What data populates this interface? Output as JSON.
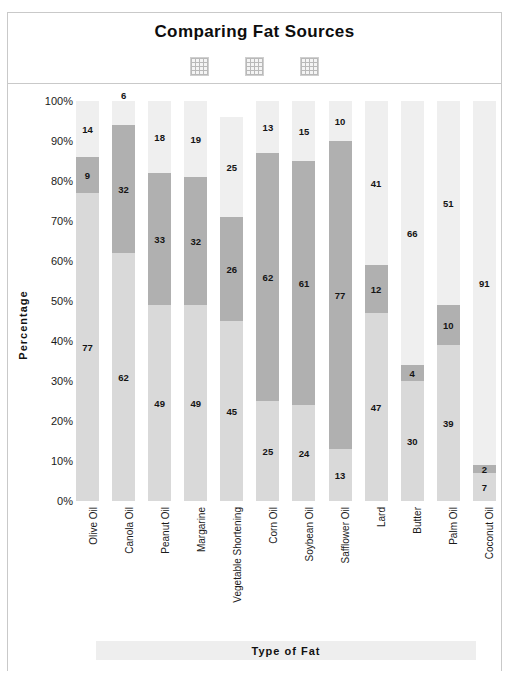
{
  "chart_data": {
    "type": "bar",
    "subtype": "stacked-bar-100-percent",
    "title": "Comparing Fat Sources",
    "xlabel": "Type of Fat",
    "ylabel": "Percentage",
    "ylim": [
      0,
      100
    ],
    "grid": false,
    "legend_position": "top",
    "legend": [
      {
        "label": "",
        "swatch": "hatched-pattern-swatch"
      },
      {
        "label": "",
        "swatch": "hatched-pattern-swatch"
      },
      {
        "label": "",
        "swatch": "hatched-pattern-swatch"
      }
    ],
    "ytick_labels": [
      "100%",
      "90%",
      "80%",
      "70%",
      "60%",
      "50%",
      "40%",
      "30%",
      "20%",
      "10%",
      "0%"
    ],
    "ytick_values": [
      100,
      90,
      80,
      70,
      60,
      50,
      40,
      30,
      20,
      10,
      0
    ],
    "categories": [
      "Olive Oil",
      "Canola Oil",
      "Peanut Oil",
      "Margarine",
      "Vegetable Shortening",
      "Corn Oil",
      "Soybean Oil",
      "Safflower Oil",
      "Lard",
      "Butter",
      "Palm Oil",
      "Coconut Oil"
    ],
    "series": [
      {
        "name": "bottom-segment",
        "color": "#d9d9d9",
        "values": [
          77,
          62,
          49,
          49,
          45,
          25,
          24,
          13,
          47,
          30,
          39,
          7
        ]
      },
      {
        "name": "middle-segment",
        "color": "#b0b0b0",
        "values": [
          9,
          32,
          33,
          32,
          26,
          62,
          61,
          77,
          12,
          4,
          10,
          2
        ]
      },
      {
        "name": "top-segment",
        "color": "#efefef",
        "values": [
          14,
          6,
          18,
          19,
          25,
          13,
          15,
          10,
          41,
          66,
          51,
          91
        ]
      }
    ]
  },
  "colors": {
    "bottom_segment": "#d9d9d9",
    "middle_segment": "#b0b0b0",
    "top_segment": "#efefef",
    "frame_border": "#c9c9c9",
    "axis_title_band": "#eeeeee",
    "text": "#1a1a1a",
    "background": "#ffffff"
  }
}
